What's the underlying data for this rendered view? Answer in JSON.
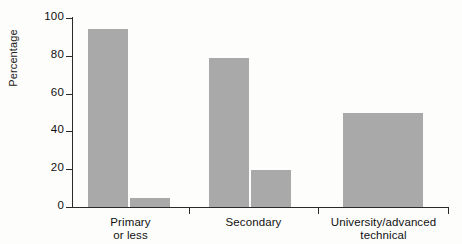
{
  "chart_data": {
    "type": "bar",
    "title": "",
    "subtitle": "",
    "xlabel": "",
    "ylabel": "Percentage",
    "ylim": [
      0,
      100
    ],
    "yticks": [
      0,
      20,
      40,
      60,
      80,
      100
    ],
    "ytick_labels": [
      "0",
      "20",
      "40",
      "60",
      "80",
      "100"
    ],
    "grid": false,
    "legend": false,
    "legend_position": "none",
    "categories": [
      "Primary or less",
      "Secondary",
      "University/advanced technical"
    ],
    "category_lines": [
      [
        "Primary",
        "or less"
      ],
      [
        "Secondary",
        ""
      ],
      [
        "University/advanced",
        "technical"
      ]
    ],
    "series": [
      {
        "name": "Series 1",
        "values": [
          94,
          79,
          50
        ]
      },
      {
        "name": "Series 2",
        "values": [
          5,
          19.5,
          49.5
        ]
      }
    ],
    "bar_color": "#a9a9a9",
    "axis_color": "#2a2a2a",
    "background_color": "#fdfdfb"
  },
  "axis": {
    "y_label": "Percentage",
    "y_ticks": [
      {
        "value": 100,
        "label": "100"
      },
      {
        "value": 80,
        "label": "80"
      },
      {
        "value": 60,
        "label": "60"
      },
      {
        "value": 40,
        "label": "40"
      },
      {
        "value": 20,
        "label": "20"
      },
      {
        "value": 0,
        "label": "0"
      }
    ]
  },
  "groups": [
    {
      "label_line1": "Primary",
      "label_line2": "or less",
      "bars": [
        {
          "value": 94,
          "name": "bar-primary-1"
        },
        {
          "value": 5,
          "name": "bar-primary-2"
        }
      ]
    },
    {
      "label_line1": "Secondary",
      "label_line2": "",
      "bars": [
        {
          "value": 79,
          "name": "bar-secondary-1"
        },
        {
          "value": 19.5,
          "name": "bar-secondary-2"
        }
      ]
    },
    {
      "label_line1": "University/advanced",
      "label_line2": "technical",
      "bars": [
        {
          "value": 50,
          "name": "bar-university-1"
        },
        {
          "value": 49.5,
          "name": "bar-university-2"
        }
      ]
    }
  ]
}
